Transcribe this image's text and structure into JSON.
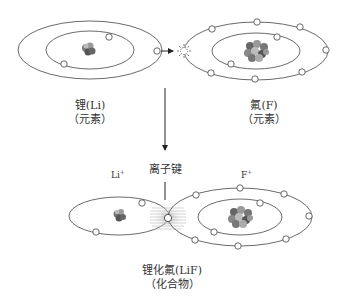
{
  "diagram": {
    "top": {
      "lithium": {
        "name": "锂(Li)",
        "type": "（元素）",
        "inner_electrons": 2,
        "outer_electrons": 1
      },
      "fluorine": {
        "name": "氟(F)",
        "type": "（元素）",
        "inner_electrons": 2,
        "outer_electrons": 7
      }
    },
    "bottom": {
      "lithium_ion": {
        "symbol": "Li",
        "charge": "+"
      },
      "fluorine_ion": {
        "symbol": "F",
        "charge": "+"
      },
      "bond_label": "离子键",
      "compound": {
        "name": "锂化氟(LiF)",
        "type": "（化合物）"
      }
    },
    "colors": {
      "line": "#444444",
      "nucleus_dark": "#555555",
      "nucleus_mid": "#888888",
      "nucleus_light": "#bbbbbb",
      "electron_fill": "#ffffff"
    }
  }
}
